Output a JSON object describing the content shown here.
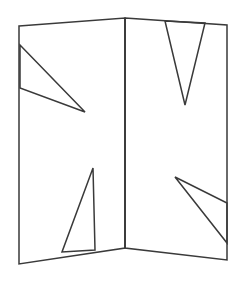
{
  "canvas": {
    "width": 242,
    "height": 283,
    "background_color": "#ffffff",
    "title": "Folded two-panel line drawing"
  },
  "style": {
    "stroke_color": "#3a3a3a",
    "stroke_width": 1.5,
    "fill": "none"
  },
  "figure": {
    "shapes": {
      "left_panel": {
        "name": "left-panel-outline",
        "points": "19,26 125,18 125,248 19,264",
        "vertices": [
          {
            "label": "top-left",
            "x": 19,
            "y": 26
          },
          {
            "label": "top-fold",
            "x": 125,
            "y": 18
          },
          {
            "label": "bottom-fold",
            "x": 125,
            "y": 248
          },
          {
            "label": "bottom-left",
            "x": 19,
            "y": 264
          }
        ]
      },
      "right_panel": {
        "name": "right-panel-outline",
        "points": "125,18 227,25 227,260 125,248",
        "vertices": [
          {
            "label": "top-fold",
            "x": 125,
            "y": 18
          },
          {
            "label": "top-right",
            "x": 227,
            "y": 25
          },
          {
            "label": "bottom-right",
            "x": 227,
            "y": 260
          },
          {
            "label": "bottom-fold",
            "x": 125,
            "y": 248
          }
        ]
      },
      "fold_line": {
        "name": "center-fold-line",
        "points": "125,18 125,248"
      },
      "left_upper_triangle": {
        "name": "left-upper-triangle",
        "points": "20,45 85,112 20,88",
        "vertices": [
          {
            "label": "upper-left",
            "x": 20,
            "y": 45
          },
          {
            "label": "apex-right",
            "x": 85,
            "y": 112
          },
          {
            "label": "lower-left",
            "x": 20,
            "y": 88
          }
        ]
      },
      "left_lower_triangle": {
        "name": "left-lower-triangle",
        "points": "93,168 95,250 62,252",
        "vertices": [
          {
            "label": "apex-top",
            "x": 93,
            "y": 168
          },
          {
            "label": "base-right",
            "x": 95,
            "y": 250
          },
          {
            "label": "base-left",
            "x": 62,
            "y": 252
          }
        ]
      },
      "right_upper_triangle": {
        "name": "right-upper-v-triangle",
        "points": "165,21 205,23 185,105",
        "vertices": [
          {
            "label": "top-left",
            "x": 165,
            "y": 21
          },
          {
            "label": "top-right",
            "x": 205,
            "y": 23
          },
          {
            "label": "apex-bottom",
            "x": 185,
            "y": 105
          }
        ]
      },
      "right_lower_triangle": {
        "name": "right-lower-triangle",
        "points": "175,177 227,203 227,243",
        "vertices": [
          {
            "label": "apex-left",
            "x": 175,
            "y": 177
          },
          {
            "label": "base-top-right",
            "x": 227,
            "y": 203
          },
          {
            "label": "base-bottom-right",
            "x": 227,
            "y": 243
          }
        ]
      }
    }
  }
}
